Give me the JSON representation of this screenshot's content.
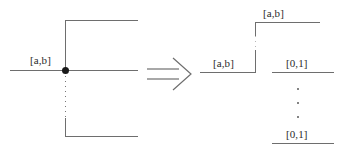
{
  "figure": {
    "background_color": "#ffffff",
    "line_color": "#6e6e6e",
    "node_color": "#1a1a1a",
    "text_color": "#2b2b2b",
    "width": 337,
    "height": 155
  },
  "left_diagram": {
    "name": "source-configuration",
    "junction_label": "[a,b]",
    "node_name": "branch-node",
    "edges": {
      "incoming_horizontal": "solid",
      "outgoing_horizontal": "solid",
      "upper_vertical": "solid",
      "lower_vertical": "dotted",
      "top_horizontal": "solid",
      "bottom_horizontal": "solid"
    }
  },
  "arrow": {
    "name": "implies-arrow",
    "glyph": "⟹",
    "meaning": "transforms-into"
  },
  "right_diagram": {
    "name": "target-configuration",
    "labels": {
      "top": "[a,b]",
      "left": "[a,b]",
      "upper_right": "[0,1]",
      "lower_right": "[0,1]"
    },
    "ellipsis": {
      "name": "vertical-ellipsis",
      "dot_count": 3
    },
    "edges": {
      "left_horizontal": "solid",
      "riser_vertical": "solid",
      "top_horizontal": "solid",
      "upper_right_horizontal": "solid",
      "lower_right_horizontal": "solid"
    }
  }
}
